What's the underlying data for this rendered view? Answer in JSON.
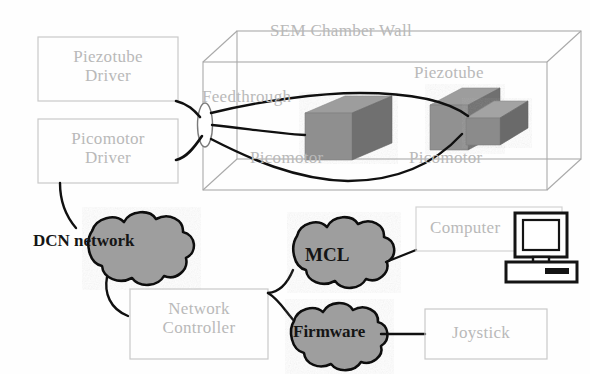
{
  "figure": {
    "kind": "system-architecture-diagram"
  },
  "chamber": {
    "title": "SEM Chamber Wall",
    "feedthrough_label": "Feedthrough",
    "piezotube_label": "Piezotube",
    "picomotor_left_label": "Picomotor",
    "picomotor_right_label": "Picomotor"
  },
  "drivers": [
    {
      "id": "piezotube-driver",
      "line1": "Piezotube",
      "line2": "Driver"
    },
    {
      "id": "picomotor-driver",
      "line1": "Picomotor",
      "line2": "Driver"
    }
  ],
  "clouds": [
    {
      "id": "dcn-network",
      "label": "DCN network"
    },
    {
      "id": "mcl",
      "label": "MCL"
    },
    {
      "id": "firmware",
      "label": "Firmware"
    }
  ],
  "boxes": [
    {
      "id": "network-controller",
      "line1": "Network",
      "line2": "Controller"
    },
    {
      "id": "computer",
      "line1": "Computer",
      "line2": ""
    },
    {
      "id": "joystick",
      "line1": "Joystick",
      "line2": ""
    }
  ],
  "icons": {
    "computer_monitor": "desktop-computer-icon"
  },
  "colors": {
    "page_background": "#fefefe",
    "faint_line": "#c9c9c9",
    "faint_text": "#b9b9b9",
    "cable": "#101010",
    "cloud_fill": "#9e9e9e",
    "cloud_stroke": "#0d0d0d",
    "block_top": "#9a9a9a",
    "block_front": "#8d8d8d",
    "block_side": "#6e6e6e",
    "dark_text": "#151515"
  }
}
